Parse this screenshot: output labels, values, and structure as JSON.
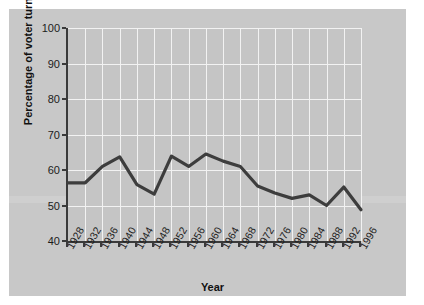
{
  "figure": {
    "background_color": "#c8c8c8",
    "page_color": "#ffffff",
    "plot_background_color": "#c5c5c5",
    "grid_color": "#f2f2f2",
    "axis_color": "#3a3a3a",
    "line_color": "#3d3d3d"
  },
  "chart_data": {
    "type": "line",
    "title": "",
    "xlabel": "Year",
    "ylabel": "Percentage of voter turnout",
    "categories": [
      "1928",
      "1932",
      "1936",
      "1940",
      "1944",
      "1948",
      "1952",
      "1956",
      "1960",
      "1964",
      "1968",
      "1972",
      "1976",
      "1980",
      "1984",
      "1988",
      "1992",
      "1996"
    ],
    "values": [
      56.4,
      56.4,
      61.0,
      63.7,
      55.9,
      53.2,
      63.9,
      61.0,
      64.5,
      62.5,
      61.0,
      55.5,
      53.5,
      52.0,
      53.0,
      50.0,
      55.2,
      48.8
    ],
    "ylim": [
      40,
      100
    ],
    "yticks": [
      40,
      50,
      60,
      70,
      80,
      90,
      100
    ],
    "ytick_labels": [
      "40",
      "50",
      "60",
      "70",
      "80",
      "90",
      "100"
    ],
    "grid": true,
    "legend": false,
    "legend_position": "none",
    "series": [
      {
        "name": "Percentage of voter turnout",
        "values": [
          56.4,
          56.4,
          61.0,
          63.7,
          55.9,
          53.2,
          63.9,
          61.0,
          64.5,
          62.5,
          61.0,
          55.5,
          53.5,
          52.0,
          53.0,
          50.0,
          55.2,
          48.8
        ]
      }
    ]
  }
}
